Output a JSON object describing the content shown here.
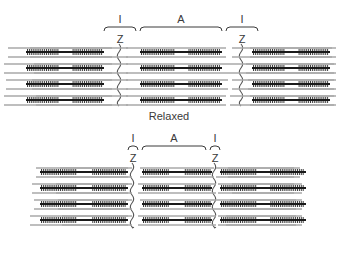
{
  "figure": {
    "background": "#ffffff",
    "ink": "#3a3a3a",
    "myosin_color": "#1a1a1a",
    "actin_color": "#a8a8a8",
    "zline_color": "#555555"
  },
  "panels": [
    {
      "id": "relaxed",
      "caption": "Relaxed",
      "brackets": [
        {
          "label": "I",
          "x": 104,
          "width": 32
        },
        {
          "label": "A",
          "x": 140,
          "width": 82
        },
        {
          "label": "I",
          "x": 226,
          "width": 32
        }
      ],
      "z_labels": [
        {
          "label": "Z",
          "x": 120
        },
        {
          "label": "Z",
          "x": 242
        }
      ],
      "z_lines_x": [
        119,
        241
      ],
      "rows": [
        {
          "actin": [
            {
              "x": 8,
              "width": 104
            },
            {
              "x": 30,
              "width": 98
            },
            {
              "x": 126,
              "width": 100
            },
            {
              "x": 232,
              "width": 100
            },
            {
              "x": 250,
              "width": 86
            }
          ],
          "myosin": [
            {
              "x": 26,
              "width": 78
            },
            {
              "x": 140,
              "width": 82
            },
            {
              "x": 252,
              "width": 78
            }
          ]
        },
        {
          "actin": [
            {
              "x": 4,
              "width": 108
            },
            {
              "x": 34,
              "width": 94
            },
            {
              "x": 126,
              "width": 104
            },
            {
              "x": 230,
              "width": 104
            },
            {
              "x": 246,
              "width": 90
            }
          ],
          "myosin": [
            {
              "x": 26,
              "width": 78
            },
            {
              "x": 140,
              "width": 82
            },
            {
              "x": 252,
              "width": 78
            }
          ]
        },
        {
          "actin": [
            {
              "x": 6,
              "width": 106
            },
            {
              "x": 32,
              "width": 96
            },
            {
              "x": 126,
              "width": 102
            },
            {
              "x": 232,
              "width": 102
            },
            {
              "x": 248,
              "width": 88
            }
          ],
          "myosin": [
            {
              "x": 26,
              "width": 78
            },
            {
              "x": 140,
              "width": 82
            },
            {
              "x": 252,
              "width": 78
            }
          ]
        },
        {
          "actin": [
            {
              "x": 4,
              "width": 108
            },
            {
              "x": 36,
              "width": 92
            },
            {
              "x": 126,
              "width": 100
            },
            {
              "x": 230,
              "width": 104
            },
            {
              "x": 250,
              "width": 86
            }
          ],
          "myosin": [
            {
              "x": 26,
              "width": 78
            },
            {
              "x": 140,
              "width": 82
            },
            {
              "x": 252,
              "width": 78
            }
          ]
        }
      ]
    },
    {
      "id": "contracted",
      "caption": "Contracted",
      "brackets": [
        {
          "label": "I",
          "x": 128,
          "width": 10
        },
        {
          "label": "A",
          "x": 142,
          "width": 64
        },
        {
          "label": "I",
          "x": 210,
          "width": 10
        }
      ],
      "z_labels": [
        {
          "label": "Z",
          "x": 133
        },
        {
          "label": "Z",
          "x": 215
        }
      ],
      "z_lines_x": [
        132,
        214
      ],
      "rows": [
        {
          "actin": [
            {
              "x": 36,
              "width": 92
            },
            {
              "x": 60,
              "width": 72
            },
            {
              "x": 140,
              "width": 74
            },
            {
              "x": 216,
              "width": 78
            },
            {
              "x": 228,
              "width": 72
            }
          ],
          "myosin": [
            {
              "x": 40,
              "width": 88
            },
            {
              "x": 142,
              "width": 70
            },
            {
              "x": 220,
              "width": 86
            }
          ]
        },
        {
          "actin": [
            {
              "x": 32,
              "width": 96
            },
            {
              "x": 56,
              "width": 76
            },
            {
              "x": 138,
              "width": 78
            },
            {
              "x": 218,
              "width": 76
            },
            {
              "x": 232,
              "width": 70
            }
          ],
          "myosin": [
            {
              "x": 40,
              "width": 88
            },
            {
              "x": 142,
              "width": 70
            },
            {
              "x": 220,
              "width": 86
            }
          ]
        },
        {
          "actin": [
            {
              "x": 34,
              "width": 94
            },
            {
              "x": 58,
              "width": 74
            },
            {
              "x": 140,
              "width": 76
            },
            {
              "x": 216,
              "width": 80
            },
            {
              "x": 230,
              "width": 72
            }
          ],
          "myosin": [
            {
              "x": 40,
              "width": 88
            },
            {
              "x": 142,
              "width": 70
            },
            {
              "x": 220,
              "width": 86
            }
          ]
        },
        {
          "actin": [
            {
              "x": 30,
              "width": 98
            },
            {
              "x": 62,
              "width": 70
            },
            {
              "x": 138,
              "width": 78
            },
            {
              "x": 218,
              "width": 78
            },
            {
              "x": 226,
              "width": 76
            }
          ],
          "myosin": [
            {
              "x": 40,
              "width": 88
            },
            {
              "x": 142,
              "width": 70
            },
            {
              "x": 220,
              "width": 86
            }
          ]
        }
      ]
    }
  ]
}
